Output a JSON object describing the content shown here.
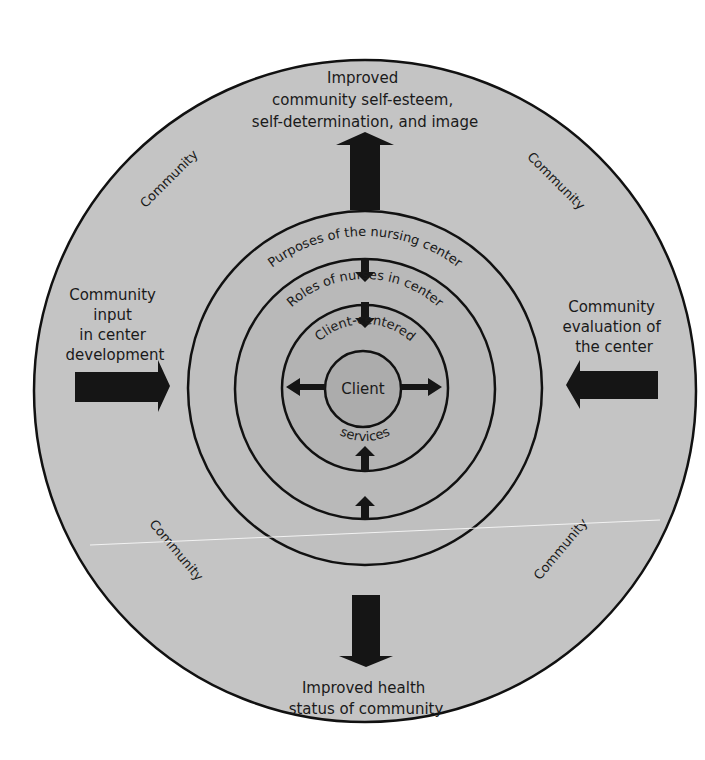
{
  "diagram": {
    "type": "concentric-circles",
    "colors": {
      "background": "#ffffff",
      "outer_fill": "#c4c4c4",
      "ring_fill": "#bdbdbd",
      "inner_fill": "#b5b5b5",
      "client_fill": "#acacac",
      "stroke": "#111111",
      "arrow": "#151515"
    },
    "outer": {
      "top_label": [
        "Improved",
        "community self-esteem,",
        "self-determination, and image"
      ],
      "bottom_label": [
        "Improved health",
        "status of community"
      ],
      "left_label": [
        "Community",
        "input",
        "in center",
        "development"
      ],
      "right_label": [
        "Community",
        "evaluation of",
        "the center"
      ],
      "community_labels": [
        "Community",
        "Community",
        "Community",
        "Community"
      ]
    },
    "rings": {
      "purposes": "Purposes of the nursing center",
      "roles": "Roles of nurses in center",
      "services_top": "Client-centered",
      "services_bottom": "services",
      "client": "Client"
    }
  }
}
